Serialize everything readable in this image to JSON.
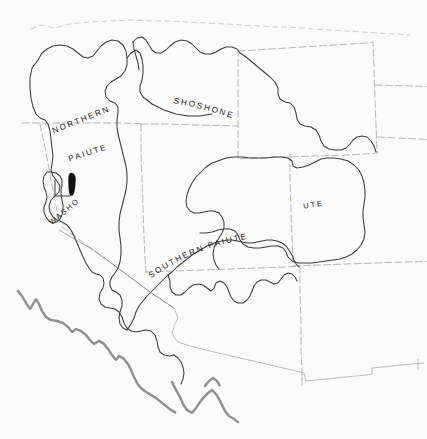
{
  "map": {
    "title": "Great Basin Native American Territories",
    "background_color": "#fbfbfa",
    "ink_color": "#3c3c3c",
    "state_border_color": "#9a9a9a",
    "lake_color": "#111111",
    "labels": {
      "northern": "NORTHERN",
      "paiute": "PAIUTE",
      "shoshone": "SHOSHONE",
      "ute": "UTE",
      "washo": "WASHO",
      "southern_paiute": "SOUTHERN  PAIUTE"
    },
    "features": {
      "lake_name": "lake-tahoe",
      "coastline_name": "pacific-coastline"
    },
    "territories": [
      {
        "name": "northern-paiute",
        "label": "NORTHERN PAIUTE"
      },
      {
        "name": "shoshone",
        "label": "SHOSHONE"
      },
      {
        "name": "ute",
        "label": "UTE"
      },
      {
        "name": "washo",
        "label": "WASHO"
      },
      {
        "name": "southern-paiute",
        "label": "SOUTHERN PAIUTE"
      }
    ]
  }
}
